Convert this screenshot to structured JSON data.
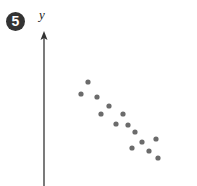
{
  "figure": {
    "badge_number": "5",
    "y_axis_label": "y"
  },
  "colors": {
    "badge_bg": "#333333",
    "badge_text": "#ffffff",
    "axis": "#333333",
    "points": "#6b6b6b"
  },
  "chart_data": {
    "type": "scatter",
    "title": "",
    "xlabel": "",
    "ylabel": "y",
    "grid": false,
    "legend": null,
    "x_axis_shown": false,
    "y_axis_shown": true,
    "tick_labels": [],
    "annotation": "5",
    "trend": "negative correlation",
    "units": "relative pixel units (x from y-axis, y up from bottom edge)",
    "points": [
      {
        "x": 44,
        "y": 104
      },
      {
        "x": 37,
        "y": 92
      },
      {
        "x": 53,
        "y": 89
      },
      {
        "x": 65,
        "y": 80
      },
      {
        "x": 57,
        "y": 72
      },
      {
        "x": 79,
        "y": 72
      },
      {
        "x": 72,
        "y": 62
      },
      {
        "x": 84,
        "y": 61
      },
      {
        "x": 91,
        "y": 54
      },
      {
        "x": 112,
        "y": 47
      },
      {
        "x": 98,
        "y": 44
      },
      {
        "x": 88,
        "y": 38
      },
      {
        "x": 105,
        "y": 35
      },
      {
        "x": 114,
        "y": 28
      }
    ]
  }
}
